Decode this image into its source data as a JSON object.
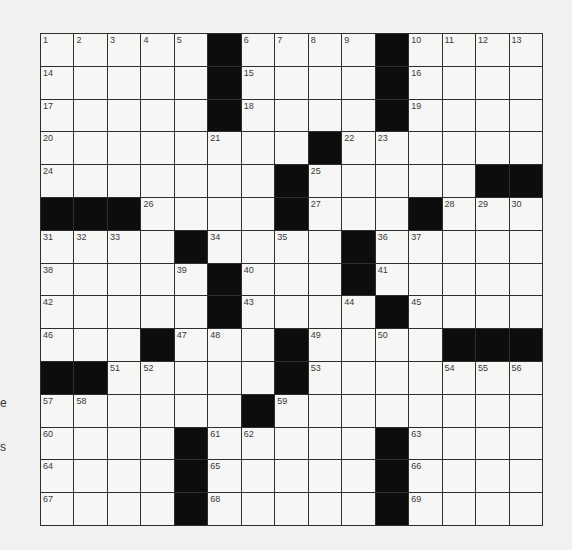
{
  "puzzle": {
    "rows": 15,
    "cols": 15,
    "layout": [
      ".....#....#....",
      ".....#....#....",
      ".....#....#....",
      "........#......",
      ".......#.....##",
      "###....#...#...",
      "....#....#.....",
      ".....#...#.....",
      ".....#....#....",
      "...#...#....###",
      "##.....#.......",
      "......#........",
      "....#.....#....",
      "....#.....#....",
      "....#.....#...."
    ],
    "numbers": [
      [
        1,
        2,
        3,
        4,
        5,
        0,
        6,
        7,
        8,
        9,
        0,
        10,
        11,
        12,
        13
      ],
      [
        14,
        0,
        0,
        0,
        0,
        0,
        15,
        0,
        0,
        0,
        0,
        16,
        0,
        0,
        0
      ],
      [
        17,
        0,
        0,
        0,
        0,
        0,
        18,
        0,
        0,
        0,
        0,
        19,
        0,
        0,
        0
      ],
      [
        20,
        0,
        0,
        0,
        0,
        21,
        0,
        0,
        0,
        22,
        23,
        0,
        0,
        0,
        0
      ],
      [
        24,
        0,
        0,
        0,
        0,
        0,
        0,
        0,
        25,
        0,
        0,
        0,
        0,
        0,
        0
      ],
      [
        0,
        0,
        0,
        26,
        0,
        0,
        0,
        0,
        27,
        0,
        0,
        0,
        28,
        29,
        30
      ],
      [
        31,
        32,
        33,
        0,
        0,
        34,
        0,
        35,
        0,
        0,
        36,
        37,
        0,
        0,
        0
      ],
      [
        38,
        0,
        0,
        0,
        39,
        0,
        40,
        0,
        0,
        0,
        41,
        0,
        0,
        0,
        0
      ],
      [
        42,
        0,
        0,
        0,
        0,
        0,
        43,
        0,
        0,
        44,
        0,
        45,
        0,
        0,
        0
      ],
      [
        46,
        0,
        0,
        0,
        47,
        48,
        0,
        0,
        49,
        0,
        50,
        0,
        0,
        0,
        0
      ],
      [
        0,
        0,
        51,
        52,
        0,
        0,
        0,
        0,
        53,
        0,
        0,
        0,
        54,
        55,
        56
      ],
      [
        57,
        58,
        0,
        0,
        0,
        0,
        0,
        59,
        0,
        0,
        0,
        0,
        0,
        0,
        0
      ],
      [
        60,
        0,
        0,
        0,
        0,
        61,
        62,
        0,
        0,
        0,
        0,
        63,
        0,
        0,
        0
      ],
      [
        64,
        0,
        0,
        0,
        0,
        65,
        0,
        0,
        0,
        0,
        0,
        66,
        0,
        0,
        0
      ],
      [
        67,
        0,
        0,
        0,
        0,
        68,
        0,
        0,
        0,
        0,
        0,
        69,
        0,
        0,
        0
      ]
    ],
    "entries": []
  },
  "margin_fragments": [
    {
      "text": "e",
      "y": 396
    },
    {
      "text": "s",
      "y": 440
    }
  ],
  "colors": {
    "background": "#f1f1ef",
    "cell": "#f6f6f4",
    "black_cell": "#0d0d0d",
    "grid_line": "#2e2e2e",
    "number_text": "#3a3a3a"
  }
}
